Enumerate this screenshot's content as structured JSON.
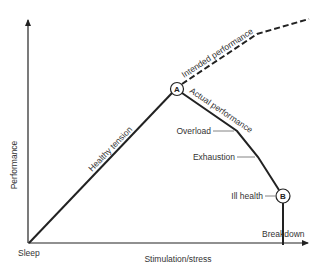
{
  "diagram": {
    "type": "performance-stress curve",
    "axes": {
      "y_label": "Performance",
      "x_label": "Stimulation/stress",
      "origin_label": "Sleep"
    },
    "curves": {
      "healthy": "Healthy tension",
      "intended": "Intended performance",
      "actual": "Actual performance"
    },
    "points": {
      "a": "A",
      "b": "B"
    },
    "annotations": {
      "overload": "Overload",
      "exhaustion": "Exhaustion",
      "ill_health": "Ill health",
      "breakdown": "Breakdown"
    }
  }
}
